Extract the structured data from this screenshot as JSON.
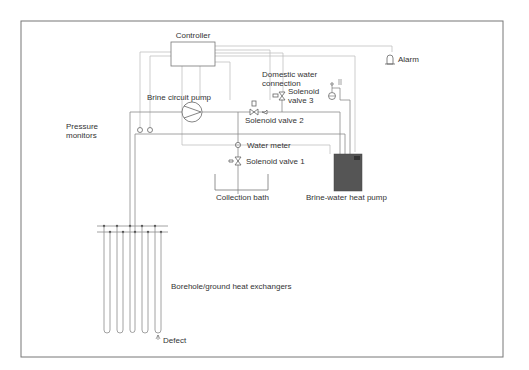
{
  "diagram": {
    "type": "ground-source heat pump brine circuit schematic",
    "colors": {
      "frame": "#777777",
      "pipe": "#8a8a8a",
      "wire": "#b8b8b8",
      "heat_pump_fill": "#555555",
      "text": "#333333"
    },
    "labels": {
      "controller": "Controller",
      "alarm": "Alarm",
      "domestic_water_1": "Domestic water",
      "domestic_water_2": "connection",
      "solenoid3_1": "Solenoid",
      "solenoid3_2": "valve 3",
      "brine_pump": "Brine circuit pump",
      "solenoid2": "Solenoid valve 2",
      "pressure_1": "Pressure",
      "pressure_2": "monitors",
      "water_meter": "Water meter",
      "solenoid1": "Solenoid valve 1",
      "collection_bath": "Collection bath",
      "heat_pump": "Brine-water heat pump",
      "boreholes": "Borehole/ground heat exchangers",
      "defect": "Defect"
    },
    "components": [
      "Controller",
      "Alarm",
      "Domestic water connection",
      "Solenoid valve 3",
      "Brine circuit pump",
      "Solenoid valve 2",
      "Pressure monitors",
      "Water meter",
      "Solenoid valve 1",
      "Collection bath",
      "Brine-water heat pump",
      "Borehole/ground heat exchangers",
      "Defect"
    ],
    "borehole_count": 5
  }
}
